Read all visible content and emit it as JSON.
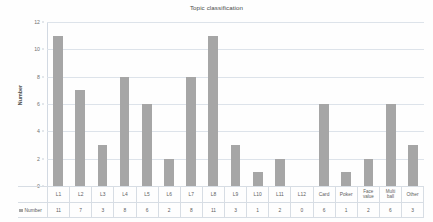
{
  "chart_data": {
    "type": "bar",
    "title": "Topic classification",
    "xlabel": "",
    "ylabel": "Number",
    "ylim": [
      0,
      12
    ],
    "yticks": [
      0,
      2,
      4,
      6,
      8,
      10,
      12
    ],
    "grid": true,
    "legend": "none",
    "series_name": "Number",
    "bar_color": "#a6a6a6",
    "grid_color": "#dde3ea",
    "categories": [
      "L1",
      "L2",
      "L3",
      "L4",
      "L5",
      "L6",
      "L7",
      "L8",
      "L9",
      "L10",
      "L11",
      "L12",
      "Card",
      "Poker",
      "Face value",
      "Multi ball",
      "Other"
    ],
    "values": [
      11,
      7,
      3,
      8,
      6,
      2,
      8,
      11,
      3,
      1,
      2,
      0,
      6,
      1,
      2,
      6,
      3
    ],
    "data_table": {
      "row_header": "Number",
      "columns": [
        "L1",
        "L2",
        "L3",
        "L4",
        "L5",
        "L6",
        "L7",
        "L8",
        "L9",
        "L10",
        "L11",
        "L12",
        "Card",
        "Poker",
        "Face value",
        "Multi ball",
        "Other"
      ],
      "values": [
        "11",
        "7",
        "3",
        "8",
        "6",
        "2",
        "8",
        "11",
        "3",
        "1",
        "2",
        "0",
        "6",
        "1",
        "2",
        "6",
        "3"
      ]
    }
  }
}
